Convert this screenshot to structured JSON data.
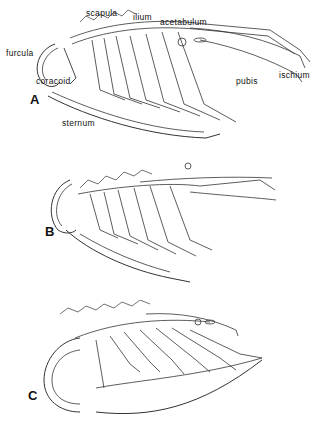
{
  "figure": {
    "panels": [
      {
        "letter": "A",
        "labels": {
          "scapula": "scapula",
          "ilium": "ilium",
          "acetabulum": "acetabulum",
          "furcula": "furcula",
          "coracoid": "coracoid",
          "pubis": "pubis",
          "ischium": "ischium",
          "sternum": "sternum"
        }
      },
      {
        "letter": "B"
      },
      {
        "letter": "C"
      }
    ],
    "line_color": "#222222",
    "background": "#ffffff"
  }
}
